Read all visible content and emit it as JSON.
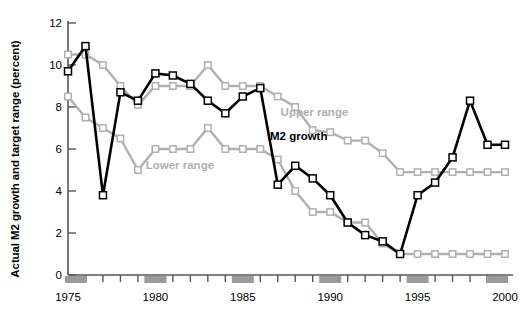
{
  "chart_data": {
    "type": "line",
    "title": "",
    "xlabel": "",
    "ylabel": "Actual M2 growth and target range (percent)",
    "xlim": [
      1975,
      2000
    ],
    "ylim": [
      0,
      12
    ],
    "ytick_values": [
      0,
      2,
      4,
      6,
      8,
      10,
      12
    ],
    "ytick_labels": [
      "0",
      "2",
      "4",
      "6",
      "8",
      "10",
      "12"
    ],
    "xtick_values": [
      1975,
      1980,
      1985,
      1990,
      1995,
      2000
    ],
    "xtick_labels": [
      "1975",
      "1980",
      "1985",
      "1990",
      "1995",
      "2000"
    ],
    "xtick_minor_values": [
      1976,
      1977,
      1978,
      1979,
      1981,
      1982,
      1983,
      1984,
      1986,
      1987,
      1988,
      1989,
      1991,
      1992,
      1993,
      1994,
      1996,
      1997,
      1998,
      1999
    ],
    "grid": false,
    "legend_position": "inline-annotations",
    "x": [
      1975,
      1976,
      1977,
      1978,
      1979,
      1980,
      1981,
      1982,
      1983,
      1984,
      1985,
      1986,
      1987,
      1988,
      1989,
      1990,
      1991,
      1992,
      1993,
      1994,
      1995,
      1996,
      1997,
      1998,
      1999,
      2000
    ],
    "series": [
      {
        "name": "M2 growth",
        "color": "#000000",
        "marker": "square-open",
        "values": [
          9.7,
          10.9,
          3.8,
          8.7,
          8.3,
          9.6,
          9.5,
          9.1,
          8.3,
          7.7,
          8.5,
          8.9,
          4.3,
          5.2,
          4.6,
          3.8,
          2.5,
          1.9,
          1.6,
          1.0,
          3.8,
          4.4,
          5.6,
          8.3,
          6.2,
          6.2
        ]
      },
      {
        "name": "Upper range",
        "color": "#b0b0b0",
        "marker": "square-open",
        "values": [
          10.5,
          10.5,
          10.0,
          9.0,
          8.1,
          9.0,
          9.0,
          9.0,
          10.0,
          9.0,
          9.0,
          9.0,
          8.5,
          8.0,
          6.9,
          6.8,
          6.4,
          6.4,
          5.8,
          4.9,
          4.9,
          4.9,
          4.9,
          4.9,
          4.9,
          4.9
        ]
      },
      {
        "name": "Lower range",
        "color": "#b0b0b0",
        "marker": "square-open",
        "values": [
          8.5,
          7.5,
          7.0,
          6.5,
          5.0,
          6.0,
          6.0,
          6.0,
          7.0,
          6.0,
          6.0,
          6.0,
          5.5,
          4.0,
          3.0,
          3.0,
          2.5,
          2.5,
          1.5,
          1.0,
          1.0,
          1.0,
          1.0,
          1.0,
          1.0,
          1.0
        ]
      }
    ],
    "annotations": [
      {
        "text": "Upper range",
        "x": 1989.1,
        "y": 7.55,
        "color": "#b0b0b0",
        "bold": true
      },
      {
        "text": "M2 growth",
        "x": 1988.2,
        "y": 6.45,
        "color": "#000000",
        "bold": true
      },
      {
        "text": "Lower range",
        "x": 1981.4,
        "y": 5.05,
        "color": "#b0b0b0",
        "bold": true
      }
    ],
    "axis_marker_color": "#9a9a9a",
    "axis_line_color": "#555555"
  }
}
